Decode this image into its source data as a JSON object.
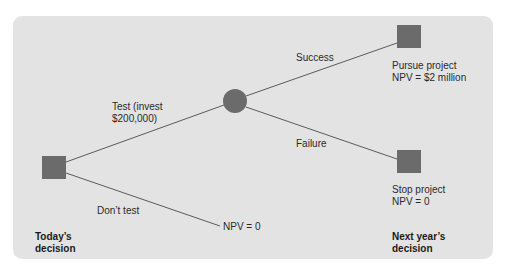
{
  "diagram": {
    "type": "decision-tree",
    "colors": {
      "background": "#e3e3e3",
      "node": "#6b6b6b",
      "line": "#5a5a5a",
      "text": "#2a2a2a"
    },
    "nodes": {
      "today_decision": {
        "shape": "square",
        "kind": "decision"
      },
      "chance": {
        "shape": "circle",
        "kind": "chance"
      },
      "pursue": {
        "shape": "square",
        "kind": "decision",
        "label_line1": "Pursue project",
        "label_line2": "NPV = $2 million"
      },
      "stop": {
        "shape": "square",
        "kind": "decision",
        "label_line1": "Stop project",
        "label_line2": "NPV = 0"
      }
    },
    "branches": {
      "test_line1": "Test (invest",
      "test_line2": "$200,000)",
      "dont_test": "Don’t test",
      "dont_test_outcome": "NPV = 0",
      "success": "Success",
      "failure": "Failure"
    },
    "footers": {
      "today_line1": "Today’s",
      "today_line2": "decision",
      "next_line1": "Next year’s",
      "next_line2": "decision"
    }
  }
}
